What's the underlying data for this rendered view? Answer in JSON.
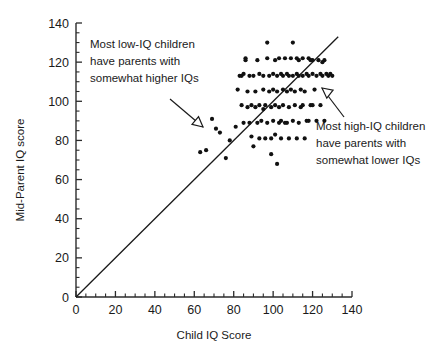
{
  "chart_data": {
    "type": "scatter",
    "title": "",
    "xlabel": "Child IQ Score",
    "ylabel": "Mid-Parent IQ score",
    "xlim": [
      0,
      140
    ],
    "ylim": [
      0,
      140
    ],
    "xticks": [
      0,
      20,
      40,
      60,
      80,
      100,
      120,
      140
    ],
    "yticks": [
      0,
      20,
      40,
      60,
      80,
      100,
      120,
      140
    ],
    "xtick_labels": [
      "0",
      "20",
      "40",
      "60",
      "80",
      "100",
      "120",
      "140"
    ],
    "ytick_labels": [
      "0",
      "20",
      "40",
      "60",
      "80",
      "100",
      "120",
      "140"
    ],
    "minor_tick_step": 5,
    "grid": false,
    "legend": "none",
    "reference_line": {
      "name": "identity-line",
      "description": "y = x line of equality",
      "slope": 1,
      "intercept": 0,
      "x_from": 0,
      "y_from": 0,
      "x_to": 133,
      "y_to": 133
    },
    "points": [
      [
        63,
        74
      ],
      [
        66,
        75
      ],
      [
        69,
        91
      ],
      [
        71,
        86
      ],
      [
        73,
        84
      ],
      [
        76,
        71
      ],
      [
        78,
        80
      ],
      [
        81,
        87
      ],
      [
        82,
        106
      ],
      [
        83,
        113
      ],
      [
        84,
        113
      ],
      [
        84,
        98
      ],
      [
        85,
        114
      ],
      [
        85,
        89
      ],
      [
        86,
        122
      ],
      [
        87,
        105
      ],
      [
        88,
        113
      ],
      [
        88,
        89
      ],
      [
        89,
        98
      ],
      [
        90,
        113
      ],
      [
        90,
        77
      ],
      [
        91,
        105
      ],
      [
        92,
        89
      ],
      [
        93,
        114
      ],
      [
        93,
        98
      ],
      [
        94,
        90
      ],
      [
        95,
        113
      ],
      [
        95,
        106
      ],
      [
        96,
        98
      ],
      [
        97,
        122
      ],
      [
        97,
        89
      ],
      [
        98,
        113
      ],
      [
        98,
        105
      ],
      [
        99,
        97
      ],
      [
        99,
        81
      ],
      [
        100,
        114
      ],
      [
        100,
        106
      ],
      [
        100,
        90
      ],
      [
        101,
        98
      ],
      [
        101,
        83
      ],
      [
        102,
        113
      ],
      [
        102,
        105
      ],
      [
        103,
        122
      ],
      [
        103,
        97
      ],
      [
        104,
        114
      ],
      [
        104,
        90
      ],
      [
        105,
        113
      ],
      [
        105,
        106
      ],
      [
        105,
        98
      ],
      [
        106,
        122
      ],
      [
        106,
        89
      ],
      [
        107,
        114
      ],
      [
        107,
        105
      ],
      [
        108,
        113
      ],
      [
        108,
        97
      ],
      [
        109,
        122
      ],
      [
        109,
        106
      ],
      [
        110,
        113
      ],
      [
        110,
        90
      ],
      [
        111,
        105
      ],
      [
        111,
        98
      ],
      [
        112,
        122
      ],
      [
        112,
        114
      ],
      [
        113,
        113
      ],
      [
        113,
        89
      ],
      [
        114,
        106
      ],
      [
        114,
        97
      ],
      [
        115,
        122
      ],
      [
        115,
        113
      ],
      [
        116,
        105
      ],
      [
        117,
        114
      ],
      [
        117,
        90
      ],
      [
        118,
        122
      ],
      [
        118,
        113
      ],
      [
        119,
        98
      ],
      [
        120,
        121
      ],
      [
        120,
        114
      ],
      [
        121,
        106
      ],
      [
        122,
        113
      ],
      [
        123,
        121
      ],
      [
        124,
        114
      ],
      [
        125,
        113
      ],
      [
        126,
        121
      ],
      [
        127,
        114
      ],
      [
        128,
        113
      ],
      [
        129,
        114
      ],
      [
        130,
        113
      ],
      [
        97,
        130
      ],
      [
        110,
        130
      ],
      [
        86,
        121
      ],
      [
        92,
        121
      ],
      [
        101,
        121
      ],
      [
        113,
        121
      ],
      [
        119,
        121
      ],
      [
        125,
        120
      ],
      [
        87,
        97
      ],
      [
        91,
        97
      ],
      [
        95,
        96
      ],
      [
        103,
        89
      ],
      [
        107,
        89
      ],
      [
        99,
        73
      ],
      [
        104,
        81
      ],
      [
        108,
        81
      ],
      [
        112,
        81
      ],
      [
        116,
        81
      ],
      [
        89,
        82
      ],
      [
        93,
        81
      ],
      [
        96,
        81
      ],
      [
        102,
        68
      ],
      [
        118,
        90
      ],
      [
        122,
        90
      ],
      [
        126,
        90
      ],
      [
        120,
        98
      ],
      [
        124,
        98
      ],
      [
        115,
        98
      ]
    ],
    "annotations": [
      {
        "name": "low-iq-annotation",
        "lines": [
          "Most low-IQ children",
          "have parents with",
          "somewhat higher IQs"
        ],
        "text_x": 90,
        "text_y": 48,
        "arrow_from_x": 170,
        "arrow_from_y": 99,
        "arrow_to_x": 203,
        "arrow_to_y": 127,
        "head_rotation": 40
      },
      {
        "name": "high-iq-annotation",
        "lines": [
          "Most high-IQ children",
          "have parents with",
          "somewhat lower IQs"
        ],
        "text_x": 316,
        "text_y": 130,
        "arrow_from_x": 344,
        "arrow_from_y": 117,
        "arrow_to_x": 322,
        "arrow_to_y": 88,
        "head_rotation": -142
      }
    ]
  },
  "figure": {
    "background": "#ffffff",
    "ink_color": "#1a1a1a",
    "point_color": "#111111",
    "point_radius": 2.1,
    "width": 446,
    "height": 359
  },
  "geometry": {
    "origin_x": 76,
    "origin_y": 297,
    "x_end": 352,
    "y_top": 23
  }
}
